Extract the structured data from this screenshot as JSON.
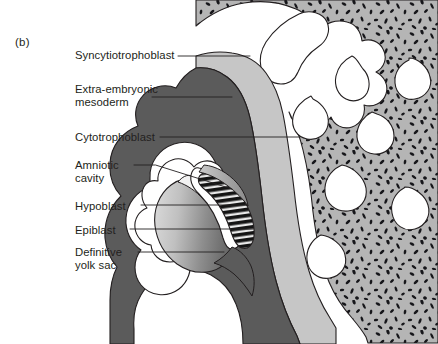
{
  "figure": {
    "panel_letter": "(b)",
    "type": "anatomical-cross-section"
  },
  "labels": [
    {
      "id": "syncytiotrophoblast",
      "text": "Syncytiotrophoblast",
      "x": 75,
      "y": 49,
      "leader": {
        "x1": 178,
        "y1": 56,
        "x2": 250,
        "y2": 56,
        "bend": false
      }
    },
    {
      "id": "extra-embryonic-mesoderm",
      "text": "Extra-embryonic\nmesoderm",
      "x": 75,
      "y": 83,
      "leader": {
        "x1": 152,
        "y1": 97,
        "x2": 232,
        "y2": 97,
        "bend": false
      }
    },
    {
      "id": "cytotrophoblast",
      "text": "Cytotrophoblast",
      "x": 75,
      "y": 131,
      "leader": {
        "x1": 160,
        "y1": 137,
        "x2": 300,
        "y2": 137,
        "bend": false
      }
    },
    {
      "id": "amniotic-cavity",
      "text": "Amniotic\ncavity",
      "x": 75,
      "y": 159,
      "leader": {
        "x1": 134,
        "y1": 165,
        "x2": 232,
        "y2": 189,
        "bend": true
      }
    },
    {
      "id": "hypoblast",
      "text": "Hypoblast",
      "x": 75,
      "y": 200,
      "leader": {
        "x1": 141,
        "y1": 205,
        "x2": 247,
        "y2": 205,
        "bend": false
      }
    },
    {
      "id": "epiblast",
      "text": "Epiblast",
      "x": 75,
      "y": 224,
      "leader": {
        "x1": 130,
        "y1": 229,
        "x2": 253,
        "y2": 229,
        "bend": false
      }
    },
    {
      "id": "definitive-yolk-sac",
      "text": "Definitive\nyolk sac",
      "x": 75,
      "y": 246,
      "leader": {
        "x1": 138,
        "y1": 252,
        "x2": 224,
        "y2": 252,
        "bend": false
      }
    }
  ],
  "colors": {
    "outline": "#231f20",
    "syncytiotrophoblast_fill": "#b3b3b3",
    "syncytiotrophoblast_lacunae": "#1a1a1a",
    "cytotrophoblast_fill": "#c4c4c4",
    "mesoderm_fill": "#5b5b5b",
    "amniotic_cavity_fill": "#ffffff",
    "epiblast_fill": "#1a1a1a",
    "yolk_sac_gradient_light": "#d2d2d2",
    "yolk_sac_gradient_dark": "#6e6e6e",
    "background": "#ffffff",
    "label_text": "#231f20",
    "leader_line": "#231f20"
  },
  "structures": [
    {
      "name": "syncytiotrophoblast",
      "description": "Outer speckled lacunar trophoblast mass with branching villi on the right side"
    },
    {
      "name": "cytotrophoblast",
      "description": "Light grey band inside the syncytiotrophoblast and scalloped ring around the embryo"
    },
    {
      "name": "extra-embryonic-mesoderm",
      "description": "Dark grey layer lining the chorionic cavity"
    },
    {
      "name": "amniotic-cavity",
      "description": "White crescent cavity above the epiblast"
    },
    {
      "name": "epiblast",
      "description": "Dark hatched columnar layer forming floor of amniotic cavity"
    },
    {
      "name": "hypoblast",
      "description": "Thin layer beneath epiblast, roof of yolk sac"
    },
    {
      "name": "definitive-yolk-sac",
      "description": "Large graded grey sac below the bilaminar disc"
    }
  ]
}
